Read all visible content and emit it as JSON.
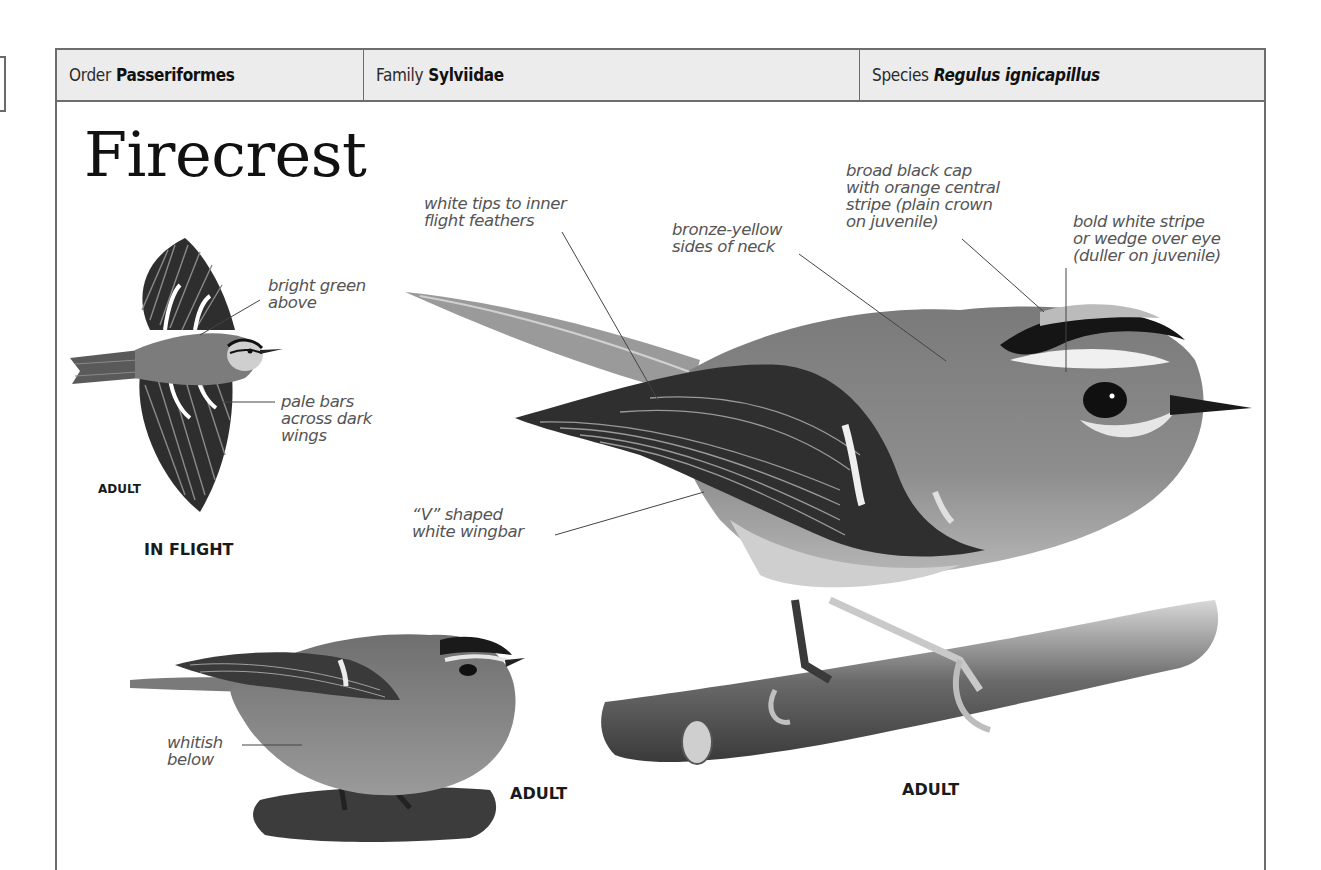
{
  "header": {
    "order_label": "Order",
    "order_value": "Passeriformes",
    "family_label": "Family",
    "family_value": "Sylviidae",
    "species_label": "Species",
    "species_value": "Regulus ignicapillus"
  },
  "title": "Firecrest",
  "in_flight": {
    "annotations": [
      {
        "id": "upperparts",
        "text": "bright green\nabove"
      },
      {
        "id": "wingbars",
        "text": "pale bars\nacross dark\nwings"
      }
    ],
    "age_label": "ADULT",
    "caption": "IN FLIGHT"
  },
  "main_photo": {
    "annotations": [
      {
        "id": "flight-feathers",
        "text": "white tips to inner\nflight feathers"
      },
      {
        "id": "neck",
        "text": "bronze-yellow\nsides of neck"
      },
      {
        "id": "cap",
        "text": "broad black cap\nwith orange central\nstripe (plain crown\non juvenile)"
      },
      {
        "id": "eyestripe",
        "text": "bold white stripe\nor wedge over eye\n(duller on juvenile)"
      },
      {
        "id": "wingbar",
        "text": "“V” shaped\nwhite wingbar"
      }
    ],
    "caption": "ADULT"
  },
  "small_photo": {
    "annotations": [
      {
        "id": "underparts",
        "text": "whitish\nbelow"
      }
    ],
    "caption": "ADULT"
  },
  "colors": {
    "header_bg": "#ececec",
    "border": "#6d6d6d",
    "annotation_text": "#555555",
    "title_text": "#111111"
  }
}
